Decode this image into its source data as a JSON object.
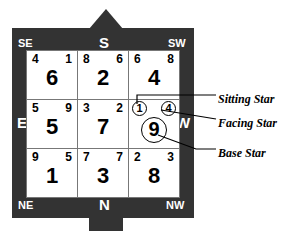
{
  "chart_data": {
    "type": "table",
    "grid_rows": [
      [
        {
          "sitting": "4",
          "facing": "1",
          "base": "6",
          "circled_sitting": false,
          "circled_facing": false,
          "circled_base": false
        },
        {
          "sitting": "8",
          "facing": "6",
          "base": "2",
          "circled_sitting": false,
          "circled_facing": false,
          "circled_base": false
        },
        {
          "sitting": "6",
          "facing": "8",
          "base": "4",
          "circled_sitting": false,
          "circled_facing": false,
          "circled_base": false
        }
      ],
      [
        {
          "sitting": "5",
          "facing": "9",
          "base": "5",
          "circled_sitting": false,
          "circled_facing": false,
          "circled_base": false
        },
        {
          "sitting": "3",
          "facing": "2",
          "base": "7",
          "circled_sitting": false,
          "circled_facing": false,
          "circled_base": false
        },
        {
          "sitting": "1",
          "facing": "4",
          "base": "9",
          "circled_sitting": true,
          "circled_facing": true,
          "circled_base": true
        }
      ],
      [
        {
          "sitting": "9",
          "facing": "5",
          "base": "1",
          "circled_sitting": false,
          "circled_facing": false,
          "circled_base": false
        },
        {
          "sitting": "7",
          "facing": "7",
          "base": "3",
          "circled_sitting": false,
          "circled_facing": false,
          "circled_base": false
        },
        {
          "sitting": "2",
          "facing": "3",
          "base": "8",
          "circled_sitting": false,
          "circled_facing": false,
          "circled_base": false
        }
      ]
    ],
    "legend": [
      "Sitting Star",
      "Facing Star",
      "Base Star"
    ]
  },
  "compass": {
    "se": "SE",
    "s": "S",
    "sw": "SW",
    "e": "E",
    "w": "W",
    "ne": "NE",
    "n": "N",
    "nw": "NW"
  },
  "annotations": {
    "sitting_star": "Sitting Star",
    "facing_star": "Facing Star",
    "base_star": "Base Star"
  },
  "colors": {
    "frame": "#333333",
    "cell_background": "#ffffff",
    "grid_line": "#777777",
    "text": "#000000",
    "label_text": "#ffffff"
  }
}
